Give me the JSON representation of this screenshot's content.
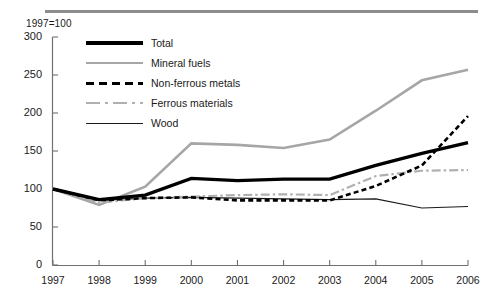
{
  "figure": {
    "unit_note": "1997=100",
    "top_rule_color": "#8c8c8c"
  },
  "legend": {
    "items": [
      {
        "label": "Total",
        "key": "thick-black-solid",
        "color": "#000000"
      },
      {
        "label": "Mineral fuels",
        "key": "gray-solid",
        "color": "#a6a6a6"
      },
      {
        "label": "Non-ferrous metals",
        "key": "black-dashed",
        "color": "#000000"
      },
      {
        "label": "Ferrous materials",
        "key": "gray-dash-dot",
        "color": "#b0b0b0"
      },
      {
        "label": "Wood",
        "key": "thin-black-solid",
        "color": "#1a1a1a"
      }
    ]
  },
  "chart_data": {
    "type": "line",
    "title": "",
    "subtitle": "",
    "xlabel": "",
    "ylabel": "1997=100",
    "x": [
      "1997",
      "1998",
      "1999",
      "2000",
      "2001",
      "2002",
      "2003",
      "2004",
      "2005",
      "2006"
    ],
    "xtick_labels": [
      "1997",
      "1998",
      "1999",
      "2000",
      "2001",
      "2002",
      "2003",
      "2004",
      "2005",
      "2006"
    ],
    "ytick_labels": [
      "0",
      "50",
      "100",
      "150",
      "200",
      "250",
      "300"
    ],
    "ytick_values": [
      0,
      50,
      100,
      150,
      200,
      250,
      300
    ],
    "ylim": [
      0,
      300
    ],
    "grid": false,
    "legend_position": "inside-top-left",
    "series": [
      {
        "name": "Total",
        "values": [
          100,
          86,
          92,
          114,
          111,
          113,
          113,
          131,
          147,
          161
        ]
      },
      {
        "name": "Mineral fuels",
        "values": [
          100,
          79,
          103,
          160,
          158,
          154,
          165,
          203,
          243,
          257
        ]
      },
      {
        "name": "Non-ferrous metals",
        "values": [
          100,
          85,
          88,
          89,
          85,
          85,
          85,
          104,
          131,
          196
        ]
      },
      {
        "name": "Ferrous materials",
        "values": [
          100,
          82,
          88,
          90,
          92,
          93,
          92,
          117,
          124,
          125
        ]
      },
      {
        "name": "Wood",
        "values": [
          100,
          85,
          88,
          89,
          88,
          87,
          86,
          87,
          75,
          77
        ]
      }
    ]
  }
}
